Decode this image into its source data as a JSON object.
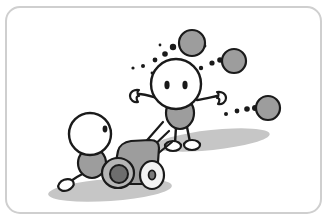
{
  "illustration": {
    "title": "Cannon firing cartoon illustration",
    "description": "A crouching stick figure fires a cannon at a standing stick figure; cannonballs fly past with dotted motion trails.",
    "canvas": {
      "width": 327,
      "height": 221,
      "background": "#ffffff"
    },
    "frame": {
      "name": "rounded-panel-border",
      "x": 6,
      "y": 7,
      "width": 315,
      "height": 206,
      "radius": 14,
      "stroke": "#cfcfcf",
      "stroke_width": 2,
      "fill": "#ffffff"
    },
    "palette": {
      "outline": "#1a1a1a",
      "fill_white": "#ffffff",
      "gray_body": "#9d9d9d",
      "gray_light": "#c9c9c9",
      "gray_dark": "#7a7a7a",
      "muzzle_dark": "#6e6e6e",
      "shadow": "#c6c6c6",
      "frame_gray": "#cfcfcf"
    },
    "shadows": [
      {
        "name": "standing-figure-shadow",
        "cx": 212,
        "cy": 140,
        "rx": 58,
        "ry": 10,
        "rotate": -6,
        "fill": "#c6c6c6"
      },
      {
        "name": "cannon-shadow",
        "cx": 110,
        "cy": 190,
        "rx": 62,
        "ry": 11,
        "rotate": -4,
        "fill": "#c6c6c6"
      }
    ],
    "standing_figure": {
      "name": "standing-figure",
      "label": "Standing figure being fired at",
      "head": {
        "cx": 176,
        "cy": 84,
        "r": 25,
        "fill": "#ffffff",
        "stroke": "#1a1a1a",
        "stroke_width": 2.4
      },
      "eyes": [
        {
          "name": "left-eye",
          "cx": 167,
          "cy": 85,
          "rx": 2.6,
          "ry": 4.2,
          "fill": "#1a1a1a"
        },
        {
          "name": "right-eye",
          "cx": 185,
          "cy": 85,
          "rx": 2.6,
          "ry": 4.2,
          "fill": "#1a1a1a"
        }
      ],
      "torso": {
        "name": "torso",
        "cx": 180,
        "cy": 113,
        "rx": 14,
        "ry": 16,
        "fill": "#9d9d9d",
        "stroke": "#1a1a1a"
      },
      "arms": [
        {
          "name": "left-arm",
          "path": "M 157 98 C 150 96 144 94 139 94",
          "hand_cx": 136,
          "hand_cy": 96
        },
        {
          "name": "right-arm",
          "path": "M 197 100 C 205 99 212 97 217 96",
          "hand_cx": 221,
          "hand_cy": 97
        }
      ],
      "legs": [
        {
          "name": "left-leg",
          "path": "M 176 127 L 175 143"
        },
        {
          "name": "right-leg",
          "path": "M 187 127 L 190 142"
        }
      ],
      "feet": [
        {
          "name": "left-foot",
          "cx": 173,
          "cy": 146,
          "rx": 8,
          "ry": 5
        },
        {
          "name": "right-foot",
          "cx": 192,
          "cy": 145,
          "rx": 8,
          "ry": 5
        }
      ]
    },
    "crouching_figure": {
      "name": "crouching-figure",
      "label": "Crouching figure firing the cannon",
      "head": {
        "cx": 90,
        "cy": 134,
        "r": 21,
        "fill": "#ffffff",
        "stroke": "#1a1a1a",
        "stroke_width": 2.4
      },
      "eye": {
        "name": "eye",
        "cx": 105,
        "cy": 129,
        "rx": 2.4,
        "ry": 3.4,
        "fill": "#1a1a1a"
      },
      "torso": {
        "name": "torso",
        "cx": 92,
        "cy": 163,
        "rx": 14,
        "ry": 15,
        "fill": "#9d9d9d",
        "stroke": "#1a1a1a"
      },
      "leg": {
        "name": "extended-leg",
        "path": "M 86 172 C 78 176 72 180 68 183"
      },
      "foot": {
        "name": "foot",
        "cx": 66,
        "cy": 185,
        "rx": 8,
        "ry": 5.5
      }
    },
    "cannon": {
      "name": "cannon",
      "label": "Cannon",
      "barrel": {
        "name": "cannon-barrel",
        "path": "M 114 172 L 118 151 C 119 146 124 142 131 141 L 150 140 C 156 140 159 143 159 148 L 157 176 C 157 181 152 184 145 184 L 122 184 C 116 184 113 179 114 172 Z",
        "fill": "#9d9d9d",
        "stroke": "#1a1a1a"
      },
      "muzzle_outer": {
        "name": "cannon-muzzle",
        "cx": 118,
        "cy": 173,
        "rx": 16,
        "ry": 15,
        "fill": "#b5b5b5",
        "stroke": "#1a1a1a"
      },
      "muzzle_bore": {
        "name": "cannon-bore",
        "cx": 119,
        "cy": 174,
        "rx": 9,
        "ry": 9,
        "fill": "#6e6e6e",
        "stroke": "#1a1a1a"
      },
      "wheel": {
        "name": "cannon-wheel",
        "cx": 152,
        "cy": 175,
        "rx": 12,
        "ry": 14,
        "fill": "#f2f2f2",
        "stroke": "#1a1a1a"
      },
      "hub": {
        "name": "cannon-wheel-hub",
        "cx": 152,
        "cy": 175,
        "rx": 3.4,
        "ry": 4.6,
        "fill": "#7a7a7a",
        "stroke": "#1a1a1a"
      }
    },
    "blast_lines": {
      "name": "blast-lines",
      "label": "Impact lines near the cannon blast",
      "stroke": "#1a1a1a",
      "stroke_width": 2.2,
      "lines": [
        "M 142 146 L 163 122",
        "M 146 153 L 169 131",
        "M 150 160 L 172 142"
      ]
    },
    "cannonballs": [
      {
        "name": "cannonball-1",
        "cx": 192,
        "cy": 43,
        "r": 13,
        "fill": "#9d9d9d",
        "stroke": "#1a1a1a"
      },
      {
        "name": "cannonball-2",
        "cx": 234,
        "cy": 61,
        "r": 12,
        "fill": "#9d9d9d",
        "stroke": "#1a1a1a"
      },
      {
        "name": "cannonball-3",
        "cx": 268,
        "cy": 108,
        "r": 12,
        "fill": "#9d9d9d",
        "stroke": "#1a1a1a"
      }
    ],
    "motion_trails": [
      {
        "name": "trail-upper-left",
        "dots": [
          {
            "cx": 133,
            "cy": 68,
            "r": 1.6
          },
          {
            "cx": 143,
            "cy": 66,
            "r": 2.0
          },
          {
            "cx": 155,
            "cy": 60,
            "r": 2.4
          },
          {
            "cx": 165,
            "cy": 54,
            "r": 2.8
          },
          {
            "cx": 173,
            "cy": 47,
            "r": 3.2
          }
        ]
      },
      {
        "name": "trail-to-ball-2",
        "dots": [
          {
            "cx": 201,
            "cy": 68,
            "r": 2.2
          },
          {
            "cx": 212,
            "cy": 63,
            "r": 2.6
          },
          {
            "cx": 220,
            "cy": 60,
            "r": 2.8
          }
        ]
      },
      {
        "name": "trail-to-ball-3",
        "dots": [
          {
            "cx": 226,
            "cy": 114,
            "r": 2.0
          },
          {
            "cx": 237,
            "cy": 111,
            "r": 2.4
          },
          {
            "cx": 247,
            "cy": 109,
            "r": 2.8
          },
          {
            "cx": 255,
            "cy": 108,
            "r": 3.0
          }
        ]
      },
      {
        "name": "trail-speckles",
        "dots": [
          {
            "cx": 196,
            "cy": 71,
            "r": 1.4
          },
          {
            "cx": 152,
            "cy": 73,
            "r": 1.4
          },
          {
            "cx": 160,
            "cy": 45,
            "r": 1.4
          },
          {
            "cx": 205,
            "cy": 46,
            "r": 1.4
          }
        ]
      }
    ]
  }
}
